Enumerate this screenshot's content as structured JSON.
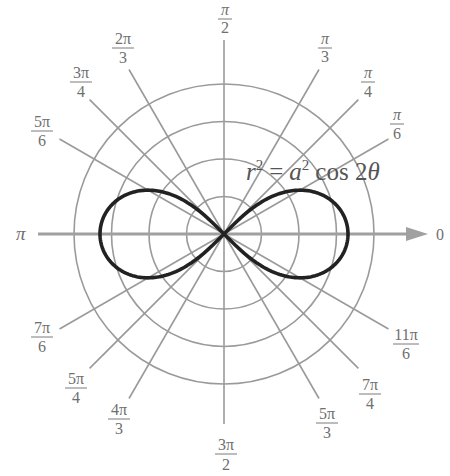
{
  "figure": {
    "equation": {
      "r": "r",
      "r_exp": "2",
      "equals": "=",
      "a": "a",
      "a_exp": "2",
      "rest": "cos 2",
      "theta": "θ"
    },
    "colors": {
      "grid": "#9a9a9a",
      "axis": "#a0a0a0",
      "curve": "#222222",
      "labels": "#6f6f6f",
      "equation": "#555555",
      "background": "#ffffff"
    }
  },
  "chart_data": {
    "type": "polar",
    "curve": {
      "name": "lemniscate",
      "equation": "r^2 = a^2 cos(2θ)",
      "a_pixels": 124,
      "right_tip_x": 347,
      "left_tip_x": 100
    },
    "center": {
      "x": 224,
      "y": 234
    },
    "grid_circles_radii_px": [
      37.5,
      75,
      112.5,
      150
    ],
    "ray_length_px": 190,
    "angle_labels": [
      {
        "angle": "0",
        "num": "",
        "den": "",
        "plain": "0"
      },
      {
        "angle": "π/6",
        "num": "π",
        "den": "6"
      },
      {
        "angle": "π/4",
        "num": "π",
        "den": "4"
      },
      {
        "angle": "π/3",
        "num": "π",
        "den": "3"
      },
      {
        "angle": "π/2",
        "num": "π",
        "den": "2"
      },
      {
        "angle": "2π/3",
        "num": "2π",
        "den": "3"
      },
      {
        "angle": "3π/4",
        "num": "3π",
        "den": "4"
      },
      {
        "angle": "5π/6",
        "num": "5π",
        "den": "6"
      },
      {
        "angle": "π",
        "num": "",
        "den": "",
        "plain": "π"
      },
      {
        "angle": "7π/6",
        "num": "7π",
        "den": "6"
      },
      {
        "angle": "5π/4",
        "num": "5π",
        "den": "4"
      },
      {
        "angle": "4π/3",
        "num": "4π",
        "den": "3"
      },
      {
        "angle": "3π/2",
        "num": "3π",
        "den": "2"
      },
      {
        "angle": "5π/3",
        "num": "5π",
        "den": "3"
      },
      {
        "angle": "7π/4",
        "num": "7π",
        "den": "4"
      },
      {
        "angle": "11π/6",
        "num": "11π",
        "den": "6"
      }
    ],
    "polar_axis_arrow": true,
    "grid": true,
    "legend": "none"
  },
  "labels": {
    "zero": "0",
    "pi": "π",
    "pi_6": {
      "num": "π",
      "den": "6"
    },
    "pi_4": {
      "num": "π",
      "den": "4"
    },
    "pi_3": {
      "num": "π",
      "den": "3"
    },
    "pi_2": {
      "num": "π",
      "den": "2"
    },
    "twopi_3": {
      "num": "2π",
      "den": "3"
    },
    "threepi_4": {
      "num": "3π",
      "den": "4"
    },
    "fivepi_6": {
      "num": "5π",
      "den": "6"
    },
    "sevenpi_6": {
      "num": "7π",
      "den": "6"
    },
    "fivepi_4": {
      "num": "5π",
      "den": "4"
    },
    "fourpi_3": {
      "num": "4π",
      "den": "3"
    },
    "threepi_2": {
      "num": "3π",
      "den": "2"
    },
    "fivepi_3": {
      "num": "5π",
      "den": "3"
    },
    "sevenpi_4": {
      "num": "7π",
      "den": "4"
    },
    "elevenpi_6": {
      "num": "11π",
      "den": "6"
    }
  }
}
